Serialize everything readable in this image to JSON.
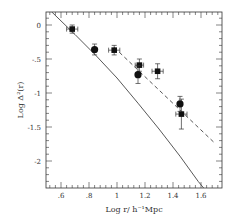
{
  "chart_data": {
    "type": "scatter",
    "title": "",
    "xlabel": "Log r/ h⁻¹Mpc",
    "ylabel": "Log Δ²(r)",
    "xlim": [
      0.49,
      1.75
    ],
    "ylim": [
      -2.4,
      0.2
    ],
    "xticks": [
      0.6,
      0.8,
      1.0,
      1.2,
      1.4,
      1.6
    ],
    "xtick_labels": [
      ".6",
      ".8",
      "1",
      "1.2",
      "1.4",
      "1.6"
    ],
    "yticks": [
      0,
      -0.5,
      -1,
      -1.5,
      -2
    ],
    "ytick_labels": [
      "0",
      "-.5",
      "-1",
      "-1.5",
      "-2"
    ],
    "grid": false,
    "legend": null,
    "series": [
      {
        "name": "squares",
        "marker": "square",
        "points": [
          {
            "x": 0.68,
            "y": -0.06,
            "xerr": 0.04,
            "yerr": 0.06
          },
          {
            "x": 0.98,
            "y": -0.37,
            "xerr": 0.04,
            "yerr": 0.07
          },
          {
            "x": 1.16,
            "y": -0.59,
            "xerr": 0.03,
            "yerr": 0.09
          },
          {
            "x": 1.29,
            "y": -0.68,
            "xerr": 0.04,
            "yerr": 0.11
          },
          {
            "x": 1.46,
            "y": -1.31,
            "xerr": 0.04,
            "yerr": 0.22
          }
        ]
      },
      {
        "name": "circles",
        "marker": "circle",
        "points": [
          {
            "x": 0.84,
            "y": -0.36,
            "xerr": 0.0,
            "yerr": 0.08
          },
          {
            "x": 1.15,
            "y": -0.73,
            "xerr": 0.0,
            "yerr": 0.13
          },
          {
            "x": 1.45,
            "y": -1.16,
            "xerr": 0.0,
            "yerr": 0.11
          }
        ]
      },
      {
        "name": "solid-curve",
        "style": "solid",
        "points": [
          {
            "x": 0.53,
            "y": 0.2
          },
          {
            "x": 0.7,
            "y": -0.14
          },
          {
            "x": 0.85,
            "y": -0.45
          },
          {
            "x": 1.0,
            "y": -0.78
          },
          {
            "x": 1.15,
            "y": -1.15
          },
          {
            "x": 1.3,
            "y": -1.53
          },
          {
            "x": 1.45,
            "y": -1.93
          },
          {
            "x": 1.58,
            "y": -2.3
          },
          {
            "x": 1.62,
            "y": -2.4
          }
        ]
      },
      {
        "name": "dashed-line",
        "style": "dashed",
        "points": [
          {
            "x": 0.98,
            "y": -0.33
          },
          {
            "x": 1.69,
            "y": -1.72
          }
        ]
      }
    ]
  }
}
